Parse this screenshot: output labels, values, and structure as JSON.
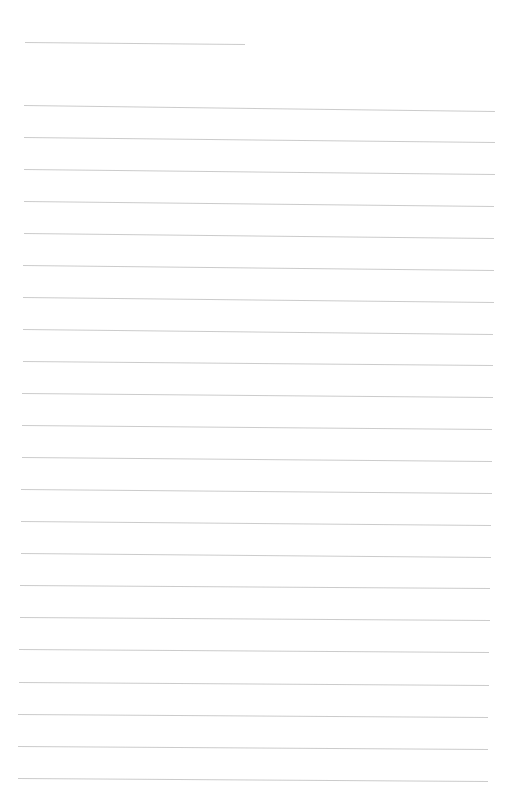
{
  "page": {
    "type": "blank lined paper",
    "line_color": "#b9b9b9",
    "background": "#ffffff",
    "header_line": {
      "y": 42,
      "x1": 25,
      "x2": 245,
      "tilt": 2
    },
    "lines": [
      {
        "y": 105,
        "x1": 24,
        "x2": 495,
        "tilt": 6
      },
      {
        "y": 137,
        "x1": 24,
        "x2": 495,
        "tilt": 5
      },
      {
        "y": 169,
        "x1": 24,
        "x2": 495,
        "tilt": 5
      },
      {
        "y": 201,
        "x1": 24,
        "x2": 494,
        "tilt": 5
      },
      {
        "y": 233,
        "x1": 24,
        "x2": 494,
        "tilt": 5
      },
      {
        "y": 265,
        "x1": 23,
        "x2": 494,
        "tilt": 5
      },
      {
        "y": 297,
        "x1": 23,
        "x2": 494,
        "tilt": 5
      },
      {
        "y": 329,
        "x1": 23,
        "x2": 493,
        "tilt": 5
      },
      {
        "y": 361,
        "x1": 23,
        "x2": 493,
        "tilt": 4
      },
      {
        "y": 393,
        "x1": 22,
        "x2": 493,
        "tilt": 4
      },
      {
        "y": 425,
        "x1": 22,
        "x2": 492,
        "tilt": 4
      },
      {
        "y": 457,
        "x1": 22,
        "x2": 492,
        "tilt": 4
      },
      {
        "y": 489,
        "x1": 21,
        "x2": 492,
        "tilt": 4
      },
      {
        "y": 521,
        "x1": 21,
        "x2": 491,
        "tilt": 4
      },
      {
        "y": 553,
        "x1": 21,
        "x2": 491,
        "tilt": 4
      },
      {
        "y": 585,
        "x1": 20,
        "x2": 490,
        "tilt": 3
      },
      {
        "y": 617,
        "x1": 20,
        "x2": 490,
        "tilt": 3
      },
      {
        "y": 649,
        "x1": 19,
        "x2": 489,
        "tilt": 3
      },
      {
        "y": 682,
        "x1": 19,
        "x2": 489,
        "tilt": 3
      },
      {
        "y": 714,
        "x1": 18,
        "x2": 488,
        "tilt": 3
      },
      {
        "y": 746,
        "x1": 18,
        "x2": 488,
        "tilt": 3
      },
      {
        "y": 778,
        "x1": 18,
        "x2": 488,
        "tilt": 3
      }
    ]
  }
}
